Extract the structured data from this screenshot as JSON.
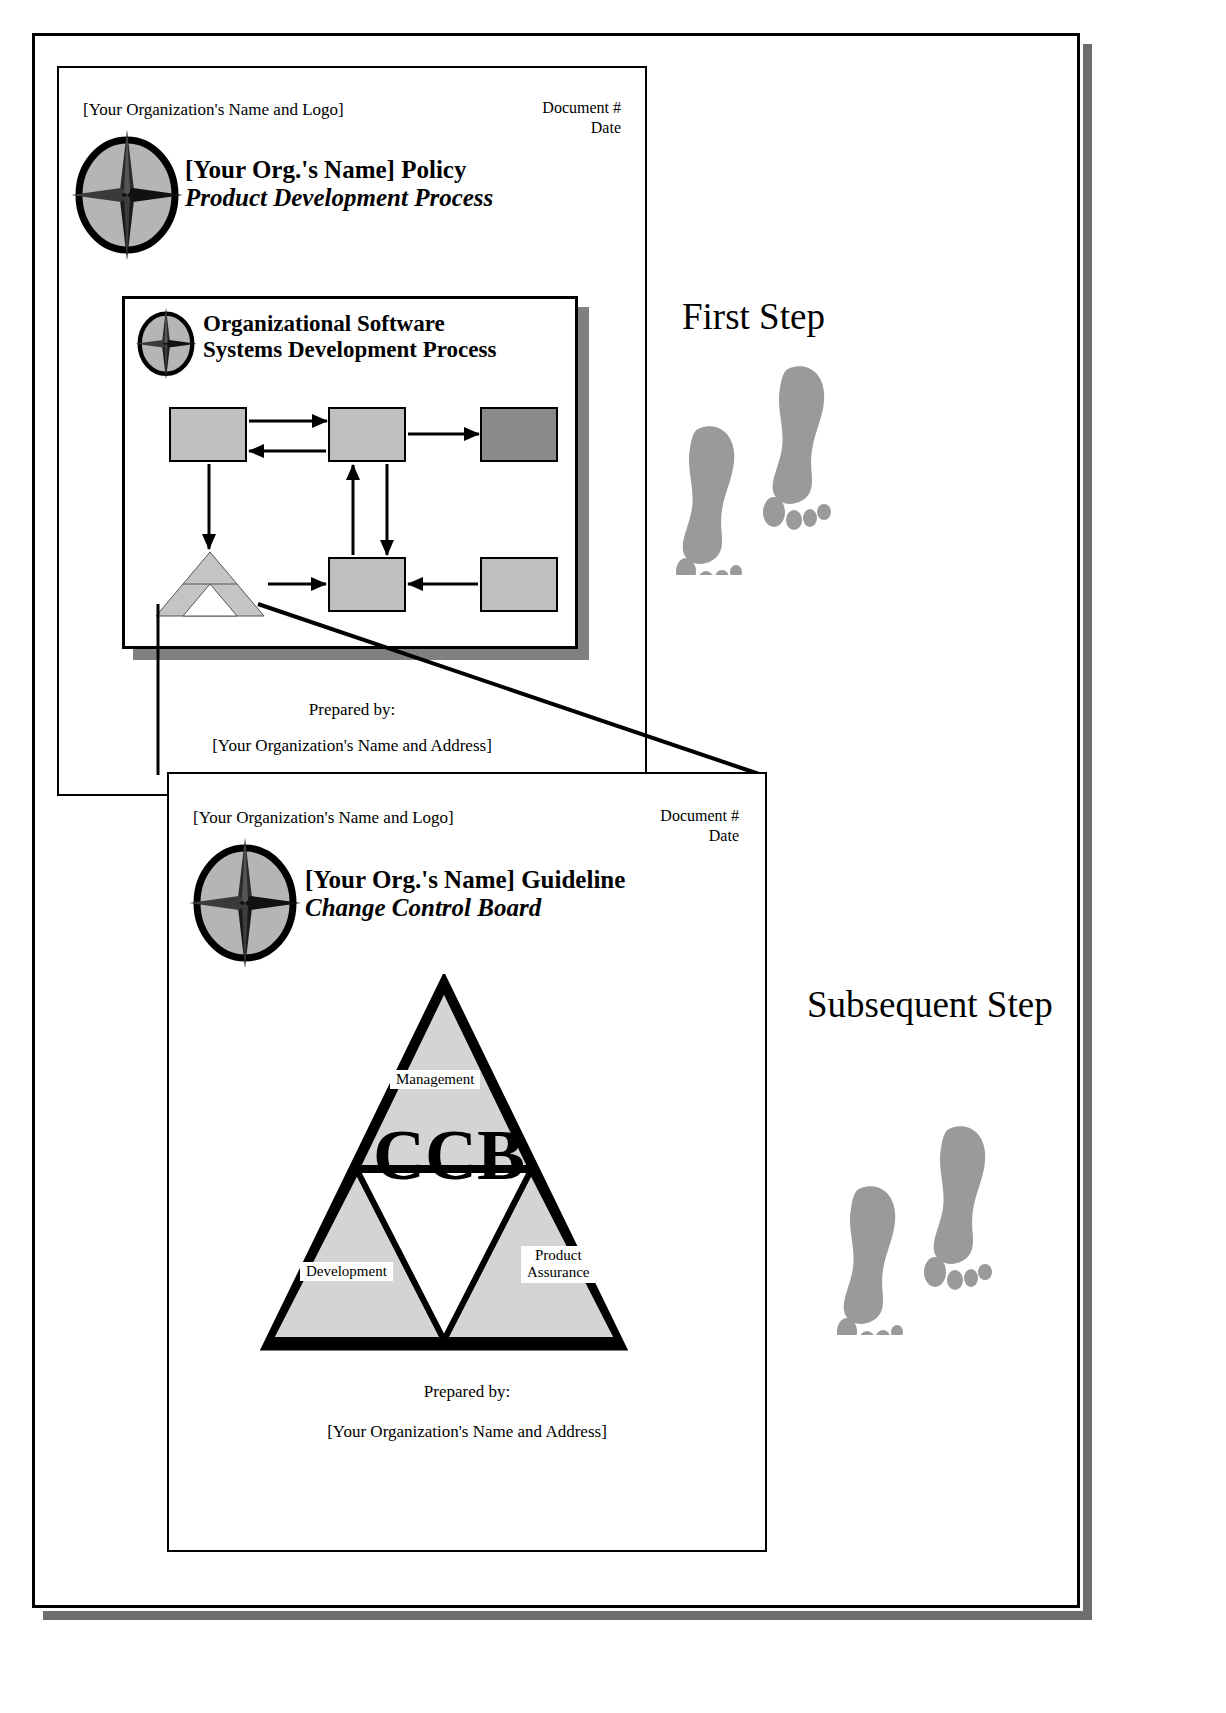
{
  "frame": {
    "shadow_color": "#6e6e6e",
    "border_color": "#000000"
  },
  "policy_page": {
    "org_logo_line": "[Your Organization's Name and Logo]",
    "document_number_label": "Document #",
    "date_label": "Date",
    "title_main": "[Your Org.'s Name] Policy",
    "title_sub": "Product Development Process",
    "prepared_by_label": "Prepared by:",
    "prepared_by_value": "[Your Organization's Name and Address]",
    "logo_icon": "compass-star-icon"
  },
  "process_box": {
    "title_line1": "Organizational Software",
    "title_line2": "Systems Development Process",
    "logo_icon": "compass-star-icon",
    "box_fill": "#bfbfbf",
    "box_fill_dark": "#8a8a8a",
    "shadow_color": "#808080",
    "nodes": [
      {
        "id": "node-top-left",
        "fill": "light"
      },
      {
        "id": "node-top-mid",
        "fill": "light"
      },
      {
        "id": "node-top-right",
        "fill": "dark"
      },
      {
        "id": "node-bottom-mid",
        "fill": "light"
      },
      {
        "id": "node-bottom-right",
        "fill": "light"
      }
    ],
    "triangle_node": {
      "id": "node-sierpinski-triangle",
      "fill": "#c4c4c4"
    },
    "arrows": [
      {
        "from": "node-top-left",
        "to": "node-top-mid",
        "direction": "right"
      },
      {
        "from": "node-top-mid",
        "to": "node-top-left",
        "direction": "left"
      },
      {
        "from": "node-top-mid",
        "to": "node-top-right",
        "direction": "right"
      },
      {
        "from": "node-top-left",
        "to": "node-sierpinski-triangle",
        "direction": "down"
      },
      {
        "from": "node-bottom-mid",
        "to": "node-top-mid",
        "direction": "up"
      },
      {
        "from": "node-top-mid",
        "to": "node-bottom-mid",
        "direction": "down"
      },
      {
        "from": "node-sierpinski-triangle",
        "to": "node-bottom-mid",
        "direction": "right"
      },
      {
        "from": "node-bottom-right",
        "to": "node-bottom-mid",
        "direction": "left"
      }
    ]
  },
  "guideline_page": {
    "org_logo_line": "[Your Organization's Name and Logo]",
    "document_number_label": "Document #",
    "date_label": "Date",
    "title_main": "[Your Org.'s Name] Guideline",
    "title_sub": "Change Control Board",
    "prepared_by_label": "Prepared by:",
    "prepared_by_value": "[Your Organization's Name and Address]",
    "logo_icon": "compass-star-icon"
  },
  "ccb_diagram": {
    "center_text": "CCB",
    "segments": [
      {
        "id": "segment-management",
        "label": "Management",
        "position": "top"
      },
      {
        "id": "segment-development",
        "label": "Development",
        "position": "bottom-left"
      },
      {
        "id": "segment-product-assurance",
        "label": "Product\nAssurance",
        "label_line1": "Product",
        "label_line2": "Assurance",
        "position": "bottom-right"
      }
    ],
    "fill": "#d4d4d4",
    "outline": "#000000"
  },
  "steps": {
    "first": {
      "label": "First Step",
      "footprints_icon": "footprints-icon",
      "footprint_color": "#9a9a9a"
    },
    "subsequent": {
      "label": "Subsequent Step",
      "footprints_icon": "footprints-icon",
      "footprint_color": "#9a9a9a"
    }
  }
}
